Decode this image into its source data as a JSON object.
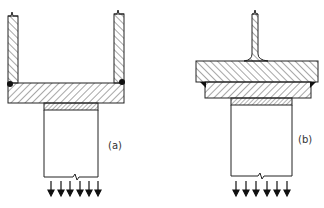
{
  "figure": {
    "panels": [
      {
        "id": "a",
        "label": "(a)",
        "description": "Two vertical plates welded onto a horizontal base plate, seated on a column with a bearing strip; distributed load arrows below"
      },
      {
        "id": "b",
        "label": "(b)",
        "description": "Tee stem on a thick top plate over a second plate with corner welds, seated on a column with a bearing strip; distributed load arrows below"
      }
    ],
    "arrow_count_per_panel": 6,
    "colors": {
      "line": "#222222",
      "background": "#ffffff"
    }
  }
}
